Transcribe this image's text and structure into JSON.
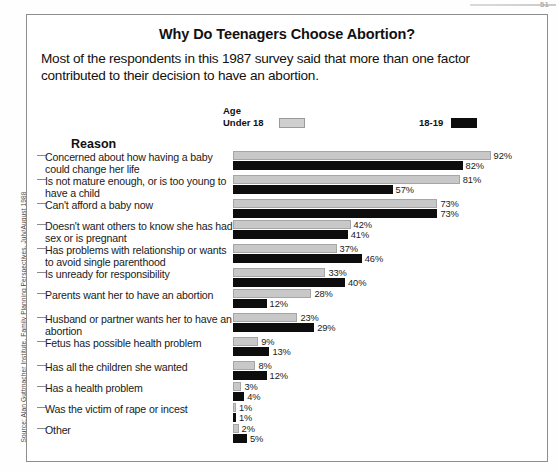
{
  "frame": {
    "title": "Why Do Teenagers Choose Abortion?",
    "subtitle": "Most of the respondents in this 1987 survey said that more than one factor contributed to their decision to have an abortion.",
    "reason_header": "Reason",
    "source": "Source: Alan Guttmacher Institute, Family Planning Perspectives, July/August 1988",
    "page_corner": "51"
  },
  "legend": {
    "group_title": "Age",
    "series_a_label": "Under 18",
    "series_b_label": "18-19",
    "series_a_color": "#c8c8c8",
    "series_b_color": "#0d0d0d"
  },
  "chart_data": {
    "type": "bar",
    "title": "Why Do Teenagers Choose Abortion?",
    "subtitle": "Most of the respondents in this 1987 survey said that more than one factor contributed to their decision to have an abortion.",
    "xlabel": "",
    "ylabel": "Reason",
    "orientation": "horizontal",
    "grid": false,
    "legend_position": "top",
    "xlim": [
      0,
      100
    ],
    "value_suffix": "%",
    "categories": [
      "Concerned about how having a baby could change her life",
      "Is not mature enough, or is too young to have a child",
      "Can't afford a baby now",
      "Doesn't want others to know she has had sex or is pregnant",
      "Has problems with relationship or wants to avoid single parenthood",
      "Is unready for responsibility",
      "Parents want her to have an abortion",
      "Husband or partner wants her to have an abortion",
      "Fetus has possible health problem",
      "Has all the children she wanted",
      "Has a health problem",
      "Was the victim of rape or incest",
      "Other"
    ],
    "series": [
      {
        "name": "Under 18",
        "color": "#c8c8c8",
        "values": [
          92,
          81,
          73,
          42,
          37,
          33,
          28,
          23,
          9,
          8,
          3,
          1,
          2
        ],
        "labels": [
          "92%",
          "81%",
          "73%",
          "42%",
          "37%",
          "33%",
          "28%",
          "23%",
          "9%",
          "8%",
          "3%",
          "1%",
          "2%"
        ]
      },
      {
        "name": "18-19",
        "color": "#0d0d0d",
        "values": [
          82,
          57,
          73,
          41,
          46,
          40,
          12,
          29,
          13,
          12,
          4,
          1,
          5
        ],
        "labels": [
          "82%",
          "57%",
          "73%",
          "41%",
          "46%",
          "40%",
          "12%",
          "29%",
          "13%",
          "12%",
          "4%",
          "1%",
          "5%"
        ]
      }
    ]
  },
  "rows": [
    {
      "label": "Concerned about how having a baby could change her life",
      "lines": 2,
      "a": 92,
      "b": 82,
      "a_label": "92%",
      "b_label": "82%"
    },
    {
      "label": "Is not mature enough, or is too young to have a child",
      "lines": 2,
      "a": 81,
      "b": 57,
      "a_label": "81%",
      "b_label": "57%"
    },
    {
      "label": "Can't afford a baby now",
      "lines": 1,
      "a": 73,
      "b": 73,
      "a_label": "73%",
      "b_label": "73%"
    },
    {
      "label": "Doesn't want others to know she has had sex or is pregnant",
      "lines": 2,
      "a": 42,
      "b": 41,
      "a_label": "42%",
      "b_label": "41%"
    },
    {
      "label": "Has problems with relationship or wants to avoid single parenthood",
      "lines": 2,
      "a": 37,
      "b": 46,
      "a_label": "37%",
      "b_label": "46%"
    },
    {
      "label": "Is unready for responsibility",
      "lines": 1,
      "a": 33,
      "b": 40,
      "a_label": "33%",
      "b_label": "40%"
    },
    {
      "label": "Parents want her to have an abortion",
      "lines": 2,
      "a": 28,
      "b": 12,
      "a_label": "28%",
      "b_label": "12%"
    },
    {
      "label": "Husband or partner wants her to have an abortion",
      "lines": 2,
      "a": 23,
      "b": 29,
      "a_label": "23%",
      "b_label": "29%"
    },
    {
      "label": "Fetus has possible health problem",
      "lines": 2,
      "a": 9,
      "b": 13,
      "a_label": "9%",
      "b_label": "13%"
    },
    {
      "label": "Has all the children she wanted",
      "lines": 1,
      "a": 8,
      "b": 12,
      "a_label": "8%",
      "b_label": "12%"
    },
    {
      "label": "Has a health problem",
      "lines": 1,
      "a": 3,
      "b": 4,
      "a_label": "3%",
      "b_label": "4%"
    },
    {
      "label": "Was the victim of rape or incest",
      "lines": 1,
      "a": 1,
      "b": 1,
      "a_label": "1%",
      "b_label": "1%"
    },
    {
      "label": "Other",
      "lines": 1,
      "a": 2,
      "b": 5,
      "a_label": "2%",
      "b_label": "5%"
    }
  ]
}
